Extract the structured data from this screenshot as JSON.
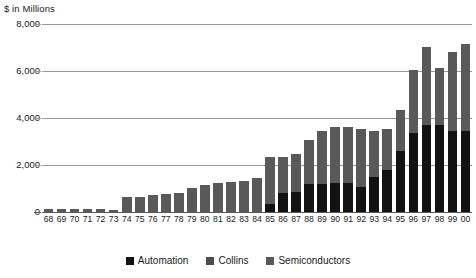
{
  "chart_data": {
    "type": "bar",
    "stacked": true,
    "title": "$ in Millions",
    "xlabel": "",
    "ylabel": "$ in Millions",
    "ylim": [
      0,
      8000
    ],
    "yticks": [
      0,
      2000,
      4000,
      6000,
      8000
    ],
    "ytick_labels": [
      "0",
      "2,000",
      "4,000",
      "6,000",
      "8,000"
    ],
    "grid": true,
    "legend_position": "bottom-center",
    "categories": [
      "68",
      "69",
      "70",
      "71",
      "72",
      "73",
      "74",
      "75",
      "76",
      "77",
      "78",
      "79",
      "80",
      "81",
      "82",
      "83",
      "84",
      "85",
      "86",
      "87",
      "88",
      "89",
      "90",
      "91",
      "92",
      "93",
      "94",
      "95",
      "96",
      "97",
      "98",
      "99",
      "00"
    ],
    "series": [
      {
        "name": "Automation",
        "color": "#121212",
        "values": [
          0,
          0,
          0,
          0,
          0,
          0,
          0,
          0,
          0,
          0,
          0,
          0,
          0,
          0,
          0,
          0,
          0,
          330,
          800,
          860,
          1180,
          1200,
          1230,
          1230,
          1060,
          1500,
          1800,
          2600,
          3380,
          3700,
          3700,
          3450,
          3450
        ]
      },
      {
        "name": "Collins",
        "color": "#4d4d4d",
        "values": [
          0,
          0,
          0,
          0,
          0,
          0,
          0,
          0,
          0,
          0,
          0,
          0,
          0,
          0,
          0,
          0,
          0,
          0,
          0,
          0,
          0,
          0,
          0,
          0,
          0,
          0,
          0,
          0,
          0,
          0,
          0,
          0,
          0
        ]
      },
      {
        "name": "Semiconductors",
        "color": "#595959",
        "values": [
          110,
          120,
          125,
          130,
          130,
          100,
          650,
          640,
          740,
          750,
          800,
          1020,
          1140,
          1220,
          1290,
          1330,
          1450,
          2020,
          1560,
          1630,
          1900,
          2250,
          2400,
          2400,
          2490,
          1930,
          1740,
          1750,
          2680,
          3310,
          2450,
          3350,
          3700
        ]
      }
    ],
    "totals": [
      110,
      120,
      125,
      130,
      130,
      100,
      650,
      640,
      740,
      750,
      800,
      1020,
      1140,
      1220,
      1290,
      1330,
      1450,
      2350,
      2360,
      2490,
      3080,
      3450,
      3630,
      3630,
      3550,
      3430,
      3540,
      4350,
      6060,
      7010,
      6150,
      6800,
      7150
    ]
  },
  "legend": {
    "items": [
      {
        "label": "Automation",
        "color": "#121212"
      },
      {
        "label": "Collins",
        "color": "#4d4d4d"
      },
      {
        "label": "Semiconductors",
        "color": "#595959"
      }
    ]
  }
}
